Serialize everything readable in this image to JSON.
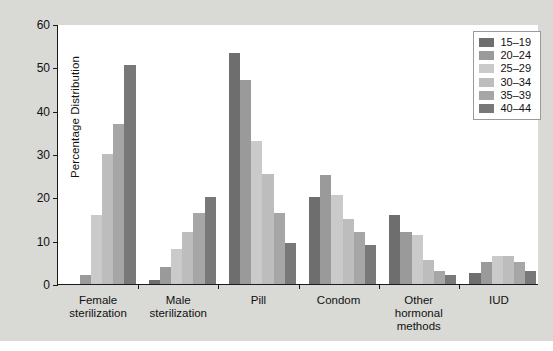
{
  "chart_data": {
    "type": "bar",
    "title": "",
    "xlabel": "",
    "ylabel": "Percentage Distribution",
    "ylim": [
      0,
      60
    ],
    "yticks": [
      0,
      10,
      20,
      30,
      40,
      50,
      60
    ],
    "grid": false,
    "legend_position": "top-right",
    "legend_title": "",
    "categories": [
      "Female\nsterilization",
      "Male\nsterilization",
      "Pill",
      "Condom",
      "Other\nhormonal\nmethods",
      "IUD"
    ],
    "series": [
      {
        "name": "15–19",
        "color": "#6e6e6e",
        "values": [
          0.0,
          1.0,
          53.2,
          20.0,
          16.0,
          2.5
        ]
      },
      {
        "name": "20–24",
        "color": "#9a9a9a",
        "values": [
          2.0,
          4.0,
          47.0,
          25.2,
          12.0,
          5.0
        ]
      },
      {
        "name": "25–29",
        "color": "#cacaca",
        "values": [
          16.0,
          8.0,
          33.0,
          20.6,
          11.2,
          6.5
        ]
      },
      {
        "name": "30–34",
        "color": "#bdbdbd",
        "values": [
          30.0,
          12.0,
          25.5,
          15.0,
          5.5,
          6.5
        ]
      },
      {
        "name": "35–39",
        "color": "#a6a6a6",
        "values": [
          37.0,
          16.5,
          16.5,
          12.0,
          3.0,
          5.0
        ]
      },
      {
        "name": "40–44",
        "color": "#787878",
        "values": [
          50.5,
          20.0,
          9.5,
          9.0,
          2.0,
          3.0
        ]
      }
    ]
  }
}
